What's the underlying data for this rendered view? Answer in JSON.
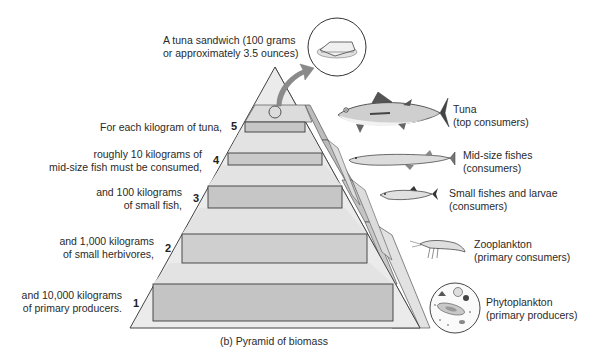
{
  "figure": {
    "caption": "(b) Pyramid of biomass",
    "sandwich_label": {
      "line1": "A tuna sandwich (100 grams",
      "line2": "or approximately 3.5 ounces)"
    },
    "levels": [
      {
        "number": "5",
        "text_line1": "For each kilogram of tuna,",
        "text_line2": ""
      },
      {
        "number": "4",
        "text_line1": "roughly 10 kilograms of",
        "text_line2": "mid-size fish must be consumed,"
      },
      {
        "number": "3",
        "text_line1": "and 100 kilograms",
        "text_line2": "of small fish,"
      },
      {
        "number": "2",
        "text_line1": "and 1,000 kilograms",
        "text_line2": "of small herbivores,"
      },
      {
        "number": "1",
        "text_line1": "and 10,000 kilograms",
        "text_line2": "of primary producers."
      }
    ],
    "organisms": [
      {
        "icon": "tuna-icon",
        "name": "Tuna",
        "role": "(top consumers)"
      },
      {
        "icon": "mid-size-fish-icon",
        "name": "Mid-size fishes",
        "role": "(consumers)"
      },
      {
        "icon": "small-fish-icon",
        "name": "Small fishes and larvae",
        "role": "(consumers)"
      },
      {
        "icon": "zooplankton-icon",
        "name": "Zooplankton",
        "role": "(primary consumers)"
      },
      {
        "icon": "phytoplankton-icon",
        "name": "Phytoplankton",
        "role": "(primary producers)"
      }
    ],
    "colors": {
      "pyramid_face": "#e6e6e6",
      "box_fill": "#c9c9c9",
      "side_face": "#d4d4d4",
      "side_face_dark": "#b8b8b8",
      "outline": "#3a3a3a",
      "arrow": "#8a8a8a"
    }
  }
}
